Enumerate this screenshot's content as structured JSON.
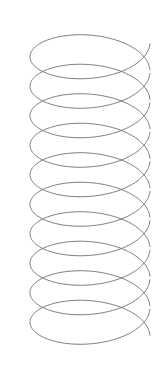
{
  "figure": {
    "kind": "line-drawing",
    "background_color": "#ffffff",
    "canvas": {
      "width": 162,
      "height": 370
    }
  },
  "drawing": {
    "stroke_color": "#6b6b6b",
    "stroke_width": 0.9,
    "fill": "none",
    "orientation": "vertical",
    "projection": "oblique-isometric",
    "turns": 10,
    "geometry": {
      "center_x": 90,
      "radius_x": 60,
      "radius_y": 29,
      "pitch": 29.5,
      "top_y": 42,
      "bottom_y": 320,
      "left_x": 30,
      "right_x": 150
    },
    "notes": [
      "ten overlapping ellipse turns",
      "turn spacing smaller than ellipse height so loops intersect",
      "open helix drawn as continuous wire, front arc passes over back arc"
    ]
  }
}
